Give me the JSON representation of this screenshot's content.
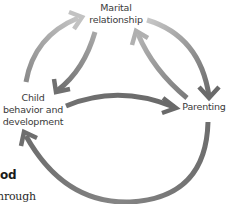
{
  "diagram": {
    "nodes": [
      {
        "id": "marital",
        "label_line1": "Marital",
        "label_line2": "relationship"
      },
      {
        "id": "child",
        "label_line1": "Child",
        "label_line2": "behavior and",
        "label_line3": "development"
      },
      {
        "id": "parenting",
        "label_line1": "Parenting"
      }
    ],
    "edges": [
      {
        "from": "child",
        "to": "marital"
      },
      {
        "from": "marital",
        "to": "child"
      },
      {
        "from": "marital",
        "to": "parenting"
      },
      {
        "from": "parenting",
        "to": "marital"
      },
      {
        "from": "child",
        "to": "parenting"
      },
      {
        "from": "parenting",
        "to": "child"
      }
    ],
    "colors": {
      "arrow_light": "#b8b8b8",
      "arrow_dark": "#707070",
      "label_text": "#3a3a3a"
    }
  },
  "page_fragment": {
    "heading_fragment": "od",
    "body_fragment": "hrough"
  }
}
